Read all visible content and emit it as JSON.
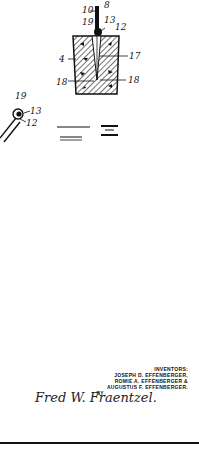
{
  "figure": {
    "label": "FIG. 3",
    "fig_text_left": "FIG.",
    "fig_text_right": "3",
    "reference_numerals": {
      "top_block": [
        "10",
        "8",
        "19",
        "13",
        "12",
        "4",
        "17",
        "18",
        "18"
      ],
      "left_detail": [
        "19",
        "13",
        "12"
      ]
    }
  },
  "labels": {
    "n10": "10",
    "n8": "8",
    "n19a": "19",
    "n13a": "13",
    "n12a": "12",
    "n4": "4",
    "n17": "17",
    "n18a": "18",
    "n18b": "18",
    "n19b": "19",
    "n13b": "13",
    "n12b": "12"
  },
  "inventors": {
    "heading": "INVENTORS:",
    "line1": "JOSEPH D. EFFENBERGER,",
    "line2": "ROMIE A. EFFENBERGER &",
    "line3": "AUGUSTUS F. EFFENBERGER.",
    "by": "BY",
    "attorney_signature": "Fred W. Fraentzel."
  },
  "colors": {
    "ink": "#111111",
    "paper": "#ffffff"
  }
}
